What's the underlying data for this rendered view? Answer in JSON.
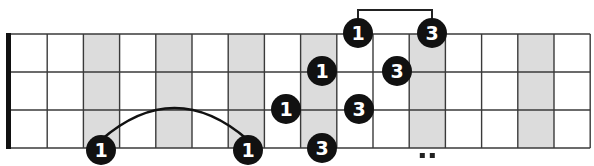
{
  "diagram": {
    "type": "fretboard",
    "strings": 4,
    "frets": 16,
    "nut_x": 11,
    "fret_width": 36.2,
    "string_y": [
      34,
      72,
      110,
      148
    ],
    "shaded_frets": [
      3,
      5,
      7,
      9,
      12,
      15
    ],
    "fret_marker_double_dot_fret": 12,
    "colors": {
      "line": "#3a3a3a",
      "nut": "#111111",
      "shade": "#dcdcdc",
      "dot": "#111111",
      "dot_text": "#ffffff"
    },
    "notes": [
      {
        "label": "1",
        "string": 1,
        "x": 358,
        "y": 33
      },
      {
        "label": "3",
        "string": 1,
        "x": 432,
        "y": 33
      },
      {
        "label": "1",
        "string": 2,
        "x": 322,
        "y": 71
      },
      {
        "label": "3",
        "string": 2,
        "x": 397,
        "y": 71
      },
      {
        "label": "1",
        "string": 3,
        "x": 286,
        "y": 109
      },
      {
        "label": "3",
        "string": 3,
        "x": 359,
        "y": 109
      },
      {
        "label": "1",
        "string": 4,
        "x": 101,
        "y": 150
      },
      {
        "label": "1",
        "string": 4,
        "x": 248,
        "y": 150
      },
      {
        "label": "3",
        "string": 4,
        "x": 322,
        "y": 148
      }
    ],
    "connectors": [
      {
        "type": "bracket",
        "from_note": 0,
        "to_note": 1,
        "top_y": 10
      },
      {
        "type": "arc",
        "from_note": 6,
        "to_note": 7,
        "peak_y": 118
      }
    ]
  }
}
